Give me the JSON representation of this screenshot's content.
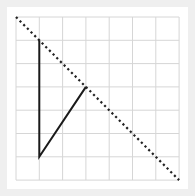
{
  "diagram": {
    "type": "grid-line-drawing",
    "grid": {
      "columns": 7,
      "rows": 7,
      "origin_px": [
        16,
        17
      ],
      "cell_px": 23.3,
      "line_color": "#d6d6d6"
    },
    "solid_path": {
      "color": "#1a1a1a",
      "points_grid": [
        [
          1,
          1
        ],
        [
          1,
          6
        ],
        [
          3,
          3
        ]
      ]
    },
    "dotted_line": {
      "color": "#222222",
      "from_grid": [
        0,
        0
      ],
      "to_grid": [
        7,
        7
      ]
    }
  }
}
